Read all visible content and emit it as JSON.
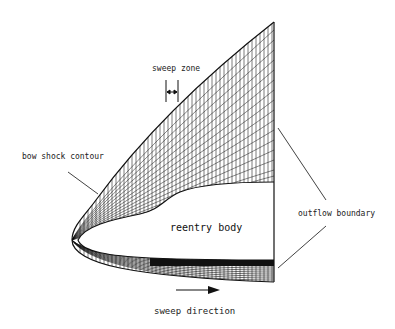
{
  "diagram": {
    "labels": {
      "sweep_zone": "sweep zone",
      "bow_shock": "bow shock contour",
      "reentry_body": "reentry body",
      "outflow_boundary": "outflow boundary",
      "sweep_direction": "sweep direction"
    },
    "colors": {
      "ink": "#111111",
      "background": "#ffffff"
    }
  }
}
